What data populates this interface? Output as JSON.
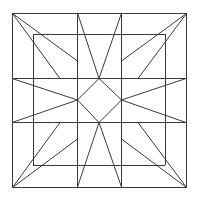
{
  "diagram": {
    "title": "",
    "kind": "quilt-block-star-pattern",
    "stroke_color": "#3a3a3a",
    "background": "#ffffff",
    "outer_square": {
      "x1": 12,
      "y1": 13,
      "x2": 186,
      "y2": 187
    },
    "grid": {
      "x": [
        77,
        121
      ],
      "y": [
        78,
        122
      ]
    },
    "center_diamond": [
      [
        99,
        78
      ],
      [
        121,
        100
      ],
      [
        99,
        122
      ],
      [
        77,
        100
      ]
    ]
  }
}
